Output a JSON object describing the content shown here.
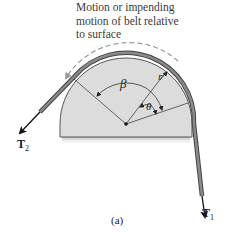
{
  "caption": {
    "lines": [
      "Motion or impending",
      "motion of belt relative",
      "to surface"
    ]
  },
  "labels": {
    "beta": "β",
    "theta": "θ",
    "radius": "r",
    "t2_main": "T",
    "t2_sub": "2",
    "t1_main": "T",
    "t1_sub": "1",
    "figure_label": "(a)"
  },
  "colors": {
    "drum_fill": "#dcdcdc",
    "drum_stroke": "#555555",
    "belt": "#8a8a8a",
    "belt_edge": "#444444",
    "arrow": "#111111",
    "dashed_arrow": "#999999"
  }
}
